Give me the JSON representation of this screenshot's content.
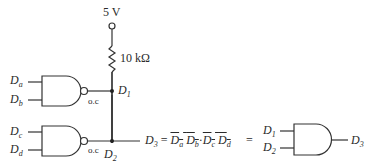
{
  "supply": {
    "voltage_label": "5 V"
  },
  "resistor": {
    "value_label": "10 kΩ"
  },
  "gate1": {
    "inputs": [
      "a",
      "b"
    ],
    "output_type": "o.c",
    "node": "1"
  },
  "gate2": {
    "inputs": [
      "c",
      "d"
    ],
    "output_type": "o.c",
    "node": "2"
  },
  "output": {
    "node": "3",
    "equals": "=",
    "term1": [
      "a",
      "b"
    ],
    "dot": "·",
    "term2": [
      "c",
      "d"
    ]
  },
  "equivalent": {
    "equals": "=",
    "inputs": [
      "1",
      "2"
    ],
    "output": "3"
  },
  "var_letter": "D"
}
